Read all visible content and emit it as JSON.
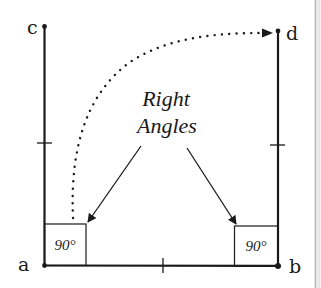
{
  "diagram": {
    "points": {
      "a": {
        "label": "a"
      },
      "b": {
        "label": "b"
      },
      "c": {
        "label": "c"
      },
      "d": {
        "label": "d"
      }
    },
    "caption": {
      "line1": "Right",
      "line2": "Angles"
    },
    "angles": {
      "left": {
        "label": "90°"
      },
      "right": {
        "label": "90°"
      }
    },
    "colors": {
      "ink": "#1a1a1a",
      "background": "#ffffff",
      "page_edge": "#b8b8b8"
    }
  }
}
